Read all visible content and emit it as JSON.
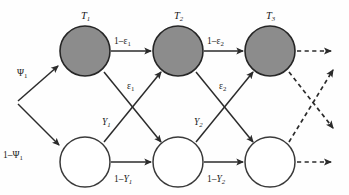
{
  "diagram": {
    "type": "state-transition-diagram",
    "background_color": "#fefefe",
    "shaded_node_color": "#8c8c8c",
    "open_node_color": "#ffffff",
    "stroke_color": "#2b2b2b",
    "top_nodes": [
      {
        "id": "T1",
        "base": "T",
        "sub": "1",
        "cx": 85,
        "cy": 51,
        "r": 25,
        "style": "shaded"
      },
      {
        "id": "T2",
        "base": "T",
        "sub": "2",
        "cx": 178,
        "cy": 51,
        "r": 25,
        "style": "shaded"
      },
      {
        "id": "T3",
        "base": "T",
        "sub": "3",
        "cx": 270,
        "cy": 51,
        "r": 25,
        "style": "shaded"
      }
    ],
    "bottom_nodes": [
      {
        "id": "B1",
        "cx": 85,
        "cy": 162,
        "r": 25,
        "style": "open"
      },
      {
        "id": "B2",
        "cx": 178,
        "cy": 162,
        "r": 25,
        "style": "open"
      },
      {
        "id": "B3",
        "cx": 270,
        "cy": 162,
        "r": 25,
        "style": "open"
      }
    ],
    "edge_labels": {
      "psi_1": {
        "prefix": "",
        "base": "Ψ",
        "sub": "1"
      },
      "one_minus_psi_1": {
        "prefix": "1–",
        "base": "Ψ",
        "sub": "1"
      },
      "one_minus_eps_1": {
        "prefix": "1–",
        "base": "ε",
        "sub": "1"
      },
      "one_minus_eps_2": {
        "prefix": "1–",
        "base": "ε",
        "sub": "2"
      },
      "eps_1": {
        "prefix": "",
        "base": "ε",
        "sub": "1"
      },
      "eps_2": {
        "prefix": "",
        "base": "ε",
        "sub": "2"
      },
      "y_1": {
        "prefix": "",
        "base": "Y",
        "sub": "1"
      },
      "y_2": {
        "prefix": "",
        "base": "Y",
        "sub": "2"
      },
      "one_minus_y_1": {
        "prefix": "1–",
        "base": "Y",
        "sub": "1"
      },
      "one_minus_y_2": {
        "prefix": "1–",
        "base": "Y",
        "sub": "2"
      }
    },
    "edges": [
      {
        "name": "entry-to-T1",
        "label": "psi_1",
        "style": "solid"
      },
      {
        "name": "entry-to-B1",
        "label": "one_minus_psi_1",
        "style": "solid"
      },
      {
        "name": "T1-to-T2",
        "label": "one_minus_eps_1",
        "style": "solid"
      },
      {
        "name": "T2-to-T3",
        "label": "one_minus_eps_2",
        "style": "solid"
      },
      {
        "name": "T1-to-B2",
        "label": "eps_1",
        "style": "solid"
      },
      {
        "name": "T2-to-B3",
        "label": "eps_2",
        "style": "solid"
      },
      {
        "name": "B1-to-T2",
        "label": "y_1",
        "style": "solid"
      },
      {
        "name": "B2-to-T3",
        "label": "y_2",
        "style": "solid"
      },
      {
        "name": "B1-to-B2",
        "label": "one_minus_y_1",
        "style": "solid"
      },
      {
        "name": "B2-to-B3",
        "label": "one_minus_y_2",
        "style": "solid"
      },
      {
        "name": "T3-continues",
        "label": null,
        "style": "dashed"
      },
      {
        "name": "B3-continues",
        "label": null,
        "style": "dashed"
      },
      {
        "name": "T3-to-next-bottom",
        "label": null,
        "style": "dashed"
      },
      {
        "name": "B3-to-next-top",
        "label": null,
        "style": "dashed"
      }
    ]
  }
}
